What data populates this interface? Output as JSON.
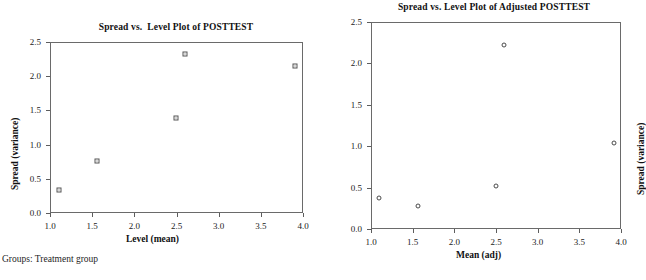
{
  "caption": "Groups: Treatment group",
  "chart_data": [
    {
      "type": "scatter",
      "id": "posttest",
      "title": "Spread vs.  Level Plot of POSTTEST",
      "xlabel": "Level (mean)",
      "ylabel": "Spread (variance)",
      "xlim": [
        1.0,
        4.0
      ],
      "ylim": [
        0.0,
        2.5
      ],
      "xticks": [
        "1.0",
        "1.5",
        "2.0",
        "2.5",
        "3.0",
        "3.5",
        "4.0"
      ],
      "xtick_values": [
        1.0,
        1.5,
        2.0,
        2.5,
        3.0,
        3.5,
        4.0
      ],
      "yticks": [
        "0.0",
        "0.5",
        "1.0",
        "1.5",
        "2.0",
        "2.5"
      ],
      "ytick_values": [
        0.0,
        0.5,
        1.0,
        1.5,
        2.0,
        2.5
      ],
      "grid": false,
      "legend": "none",
      "marker": "open-square",
      "marker_color": "#555555",
      "x": [
        1.11,
        1.56,
        2.49,
        2.6,
        3.91
      ],
      "y": [
        0.34,
        0.76,
        1.39,
        2.32,
        2.15
      ]
    },
    {
      "type": "scatter",
      "id": "adjusted-posttest",
      "title": "Spread vs. Level Plot of Adjusted POSTTEST",
      "xlabel": "Mean (adj)",
      "ylabel": "Spread (variance)",
      "xlim": [
        1.0,
        4.0
      ],
      "ylim": [
        0.0,
        2.5
      ],
      "xticks": [
        "1.0",
        "1.5",
        "2.0",
        "2.5",
        "3.0",
        "3.5",
        "4.0"
      ],
      "xtick_values": [
        1.0,
        1.5,
        2.0,
        2.5,
        3.0,
        3.5,
        4.0
      ],
      "yticks": [
        "0.0",
        "0.5",
        "1.0",
        "1.5",
        "2.0",
        "2.5"
      ],
      "ytick_values": [
        0.0,
        0.5,
        1.0,
        1.5,
        2.0,
        2.5
      ],
      "grid": false,
      "legend": "none",
      "marker": "open-circle",
      "marker_color": "#4a4a4a",
      "x": [
        1.1,
        1.56,
        2.5,
        2.6,
        3.91
      ],
      "y": [
        0.37,
        0.28,
        0.52,
        2.22,
        1.04
      ]
    }
  ],
  "colors": {
    "axis": "#6a6a6a",
    "text": "#1a1a1a",
    "background": "#ffffff"
  }
}
